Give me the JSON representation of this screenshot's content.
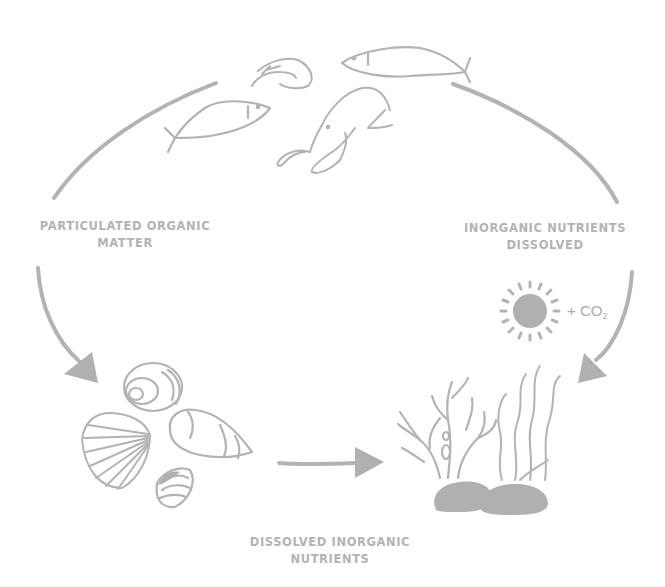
{
  "diagram": {
    "colors": {
      "stroke": "#b3b3b3",
      "fill": "#b0b0b0",
      "text": "#b3b3b3",
      "background": "#ffffff"
    },
    "labels": {
      "particulate_organic_matter": {
        "line1": "PARTICULATED ORGANIC",
        "line2": "MATTER"
      },
      "inorganic_nutrients_dissolved": {
        "line1": "INORGANIC NUTRIENTS",
        "line2": "DISSOLVED"
      },
      "dissolved_inorganic_nutrients": {
        "line1": "DISSOLVED INORGANIC",
        "line2": "NUTRIENTS"
      },
      "co2": {
        "prefix": "+ CO",
        "subscript": "2"
      }
    },
    "nodes": [
      {
        "id": "marine-animals",
        "icons": [
          "fish-icon",
          "fish-icon",
          "shrimp-icon",
          "lobster-icon"
        ]
      },
      {
        "id": "shells",
        "icons": [
          "snail-shell-icon",
          "scallop-shell-icon",
          "conch-shell-icon",
          "clam-shell-icon"
        ]
      },
      {
        "id": "plants",
        "icons": [
          "coral-icon",
          "seaweed-icon",
          "rock-icon"
        ]
      },
      {
        "id": "sunlight",
        "icons": [
          "sun-icon"
        ]
      }
    ],
    "edges": [
      {
        "from": "marine-animals",
        "to": "shells",
        "label_ref": "particulate_organic_matter"
      },
      {
        "from": "shells",
        "to": "plants",
        "label_ref": "dissolved_inorganic_nutrients"
      },
      {
        "from": "marine-animals",
        "to": "plants",
        "label_ref": "inorganic_nutrients_dissolved"
      }
    ]
  }
}
